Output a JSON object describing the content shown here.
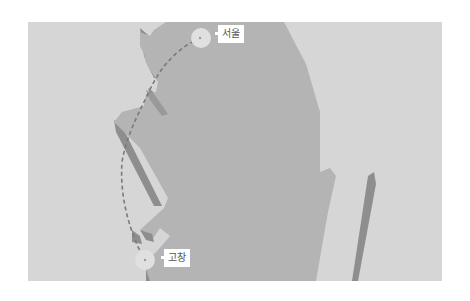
{
  "map": {
    "type": "route-map",
    "background_color": "#d6d6d6",
    "land_color": "#b4b4b4",
    "shadow_color": "#8e8e8e",
    "route_color": "#7a7a7a",
    "marker_color": "#e0e0e0",
    "route": {
      "style": "dashed",
      "from": "서울",
      "to": "고창"
    },
    "markers": [
      {
        "id": "seoul",
        "label": "서울"
      },
      {
        "id": "gochang",
        "label": "고창"
      }
    ]
  }
}
